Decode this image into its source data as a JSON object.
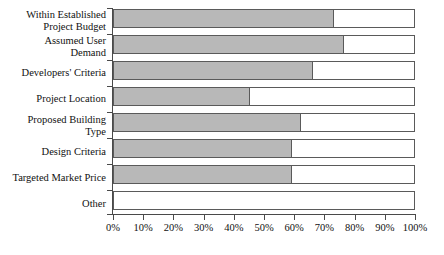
{
  "chart_data": {
    "type": "bar",
    "orientation": "horizontal",
    "title": "",
    "xlabel": "",
    "ylabel": "",
    "xlim": [
      0,
      100
    ],
    "grid": false,
    "legend": null,
    "xticklabels": [
      "0%",
      "10%",
      "20%",
      "30%",
      "40%",
      "50%",
      "60%",
      "70%",
      "80%",
      "90%",
      "100%"
    ],
    "xticks": [
      0,
      10,
      20,
      30,
      40,
      50,
      60,
      70,
      80,
      90,
      100
    ],
    "categories": [
      "Within Established\nProject Budget",
      "Assumed User\nDemand",
      "Developers' Criteria",
      "Project Location",
      "Proposed Building\nType",
      "Design Criteria",
      "Targeted Market Price",
      "Other"
    ],
    "values": [
      73,
      76,
      66,
      45,
      62,
      59,
      59,
      0
    ],
    "value_unit": "%",
    "colors": {
      "bar_fill": "#b8b8b8",
      "bar_outline": "#5a5a5a",
      "bar_background": "#ffffff",
      "axis": "#4a4a4a",
      "text": "#111111",
      "page_background": "#ffffff"
    }
  }
}
